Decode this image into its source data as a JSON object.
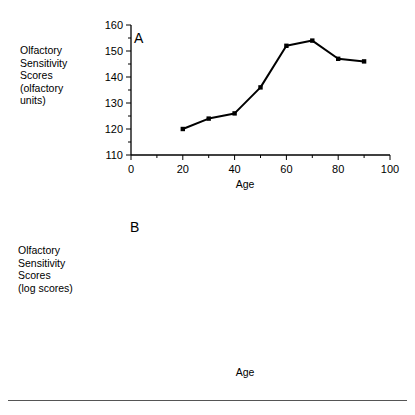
{
  "figure": {
    "background": "#ffffff",
    "line_color": "#000000",
    "marker_color": "#000000",
    "axis_color": "#000000",
    "footer_rule_color": "#555555"
  },
  "panels": [
    {
      "letter": "A",
      "y_axis_title": "Olfactory\nSensitivity\nScores\n(olfactory\nunits)",
      "x_axis_title": "Age"
    },
    {
      "letter": "B",
      "y_axis_title": "Olfactory\nSensitivity\nScores\n(log scores)",
      "x_axis_title": "Age"
    }
  ],
  "chart_data": [
    {
      "type": "line",
      "id": "panel-a",
      "title": "A",
      "xlabel": "Age",
      "ylabel": "Olfactory Sensitivity Scores (olfactory units)",
      "x": [
        20,
        30,
        40,
        50,
        60,
        70,
        80,
        90
      ],
      "values": [
        120,
        124,
        126,
        136,
        152,
        154,
        147,
        146
      ],
      "xlim": [
        0,
        100
      ],
      "ylim": [
        110,
        160
      ],
      "xticks": [
        0,
        10,
        20,
        30,
        40,
        50,
        60,
        70,
        80,
        90,
        100
      ],
      "xtick_labels": [
        "0",
        "",
        "20",
        "",
        "40",
        "",
        "60",
        "",
        "80",
        "",
        "100"
      ],
      "yticks": [
        110,
        115,
        120,
        125,
        130,
        135,
        140,
        145,
        150,
        155,
        160
      ],
      "ytick_labels": [
        "110",
        "",
        "120",
        "",
        "130",
        "",
        "140",
        "",
        "150",
        "",
        "160"
      ],
      "grid": false,
      "legend": "none",
      "marker": "square"
    },
    {
      "type": "line",
      "id": "panel-b",
      "title": "B",
      "xlabel": "Age",
      "ylabel": "Olfactory Sensitivity Scores (log scores)",
      "x": [
        20,
        30,
        40,
        50,
        60,
        70,
        80,
        90
      ],
      "values": [
        2.08,
        2.09,
        2.1,
        2.13,
        2.18,
        2.2,
        2.18,
        2.17
      ],
      "xlim": [
        0,
        100
      ],
      "ylim": [
        1,
        2.2
      ],
      "xticks": [
        0,
        10,
        20,
        30,
        40,
        50,
        60,
        70,
        80,
        90,
        100
      ],
      "xtick_labels": [
        "0",
        "",
        "20",
        "",
        "40",
        "",
        "60",
        "",
        "80",
        "",
        "100"
      ],
      "yticks": [
        1,
        1.2,
        1.4,
        1.6,
        1.8,
        2,
        2.2
      ],
      "ytick_labels": [
        "1",
        "1.2",
        "1.4",
        "1.6",
        "1.8",
        "2",
        "2.2"
      ],
      "grid": false,
      "legend": "none",
      "marker": "square"
    }
  ]
}
